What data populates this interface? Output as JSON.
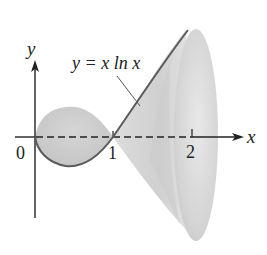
{
  "diagram": {
    "curve_label": "y = x ln x",
    "axes": {
      "x_label": "x",
      "y_label": "y",
      "ticks": [
        "0",
        "1",
        "2"
      ]
    },
    "colors": {
      "curve": "#5a5a5a",
      "surface_light": "#e4e4e4",
      "surface_mid": "#cfcfcf",
      "surface_dark": "#bdbdbd",
      "axis": "#222222"
    }
  }
}
